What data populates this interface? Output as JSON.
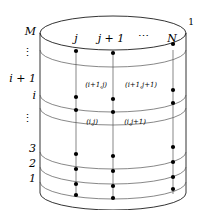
{
  "figure": {
    "row_labels": [
      {
        "text": "M",
        "y": 31
      },
      {
        "text": "⋮",
        "y": 52
      },
      {
        "text": "i + 1",
        "y": 78
      },
      {
        "text": "i",
        "y": 95
      },
      {
        "text": "⋮",
        "y": 118
      },
      {
        "text": "3",
        "y": 148
      },
      {
        "text": "2",
        "y": 163
      },
      {
        "text": "1",
        "y": 178
      }
    ],
    "column_labels": [
      {
        "text": "j",
        "x": 76,
        "y": 44
      },
      {
        "text": "j + 1",
        "x": 110,
        "y": 44
      },
      {
        "text": "⋯",
        "x": 142,
        "y": 42
      },
      {
        "text": "N",
        "x": 172,
        "y": 44
      },
      {
        "text": "1",
        "x": 189,
        "y": 23
      }
    ],
    "node_labels": [
      {
        "text": "(i+1,j)",
        "x": 96,
        "y": 85
      },
      {
        "text": "(i+1,j+1)",
        "x": 139,
        "y": 85
      },
      {
        "text": "(i,j)",
        "x": 92,
        "y": 121
      },
      {
        "text": "(i,j+1)",
        "x": 133,
        "y": 121
      }
    ],
    "geometry": {
      "cx": 113,
      "rx": 73,
      "ry": 17,
      "top_y": 33,
      "bottom_y": 193,
      "ring_y": [
        50,
        95,
        108,
        152,
        167,
        182,
        193
      ],
      "column_x": [
        76,
        113,
        173,
        186
      ],
      "node_rows_y": [
        50,
        95,
        108,
        152,
        167,
        182,
        193
      ]
    },
    "colors": {
      "stroke": "#000000",
      "node": "#000000",
      "background": "#ffffff"
    }
  }
}
